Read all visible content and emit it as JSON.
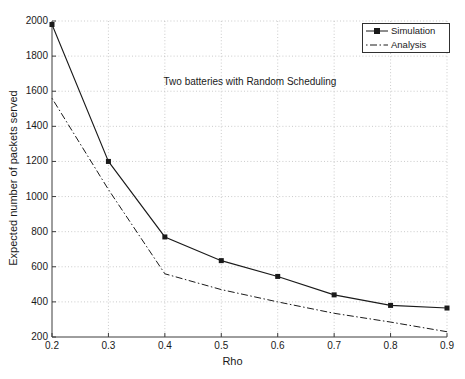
{
  "chart_data": {
    "type": "line",
    "title": "Two batteries with Random Scheduling",
    "xlabel": "Rho",
    "ylabel": "Expected number of packets served",
    "xlim": [
      0.2,
      0.9
    ],
    "ylim": [
      200,
      2000
    ],
    "xticks": [
      0.2,
      0.3,
      0.4,
      0.5,
      0.6,
      0.7,
      0.8,
      0.9
    ],
    "xtick_labels": [
      "0.2",
      "0.3",
      "0.4",
      "0.5",
      "0.6",
      "0.7",
      "0.8",
      "0.9"
    ],
    "yticks": [
      200,
      400,
      600,
      800,
      1000,
      1200,
      1400,
      1600,
      1800,
      2000
    ],
    "ytick_labels": [
      "200",
      "400",
      "600",
      "800",
      "1000",
      "1200",
      "1400",
      "1600",
      "1800",
      "2000"
    ],
    "grid": true,
    "grid_style": "dotted",
    "grid_color": "#b4b4b4",
    "legend_position": "top-right",
    "axis_color": "#3c3c3c",
    "background": "#ffffff",
    "series": [
      {
        "name": "Simulation",
        "line_style": "solid",
        "marker": "square",
        "color": "#1a1a1a",
        "x": [
          0.2,
          0.3,
          0.4,
          0.5,
          0.6,
          0.7,
          0.8,
          0.9
        ],
        "values": [
          1980,
          1200,
          770,
          635,
          545,
          440,
          380,
          365
        ]
      },
      {
        "name": "Analysis",
        "line_style": "dash-dot",
        "marker": "none",
        "color": "#1a1a1a",
        "x": [
          0.2,
          0.3,
          0.4,
          0.5,
          0.6,
          0.7,
          0.8,
          0.9
        ],
        "values": [
          1560,
          1040,
          560,
          470,
          400,
          335,
          285,
          230
        ]
      }
    ]
  },
  "legend": {
    "entries": [
      {
        "label": "Simulation"
      },
      {
        "label": "Analysis"
      }
    ]
  }
}
